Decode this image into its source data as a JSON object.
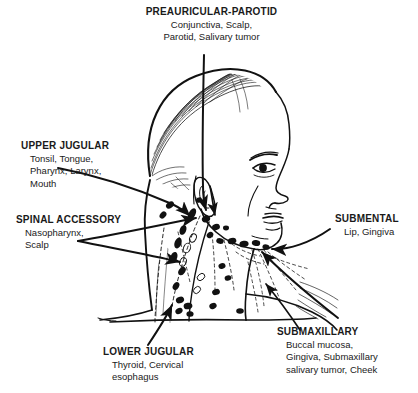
{
  "figure": {
    "ink_color": "#111111",
    "background_color": "#ffffff"
  },
  "labels": {
    "preauricular_parotid": {
      "heading": "PREAURICULAR-PAROTID",
      "line1": "Conjunctiva, Scalp,",
      "line2": "Parotid, Salivary tumor"
    },
    "upper_jugular": {
      "heading": "UPPER JUGULAR",
      "line1": "Tonsil, Tongue,",
      "line2": "Pharynx, Larynx,",
      "line3": "Mouth"
    },
    "spinal_accessory": {
      "heading": "SPINAL ACCESSORY",
      "line1": "Nasopharynx,",
      "line2": "Scalp"
    },
    "submental": {
      "heading": "SUBMENTAL",
      "line1": "Lip, Gingiva"
    },
    "submaxillary": {
      "heading": "SUBMAXILLARY",
      "line1": "Buccal mucosa,",
      "line2": "Gingiva, Submaxillary",
      "line3": "salivary tumor, Cheek"
    },
    "lower_jugular": {
      "heading": "LOWER JUGULAR",
      "line1": "Thyroid, Cervical",
      "line2": "esophagus"
    }
  }
}
